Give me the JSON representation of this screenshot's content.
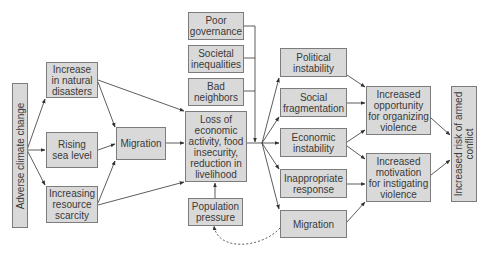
{
  "diagram": {
    "colors": {
      "box_fill": "#d9d9d9",
      "box_border": "#7c7c7c",
      "text": "#3a3a3a",
      "arrow": "#333333"
    },
    "nodes": {
      "adverse_climate_change": "Adverse climate change",
      "natural_disasters": "Increase\nin natural\ndisasters",
      "sea_level": "Rising\nsea level",
      "resource_scarcity": "Increasing\nresource\nscarcity",
      "migration_left": "Migration",
      "poor_governance": "Poor\ngovernance",
      "societal_inequalities": "Societal\ninequalities",
      "bad_neighbors": "Bad\nneighbors",
      "loss_economic": "Loss of\neconomic\nactivity, food\ninsecurity,\nreduction in\nlivelihood",
      "population_pressure": "Population\npressure",
      "political_instability": "Political\ninstability",
      "social_fragmentation": "Social\nfragmentation",
      "economic_instability": "Economic\ninstability",
      "inappropriate_response": "Inappropriate\nresponse",
      "migration_right": "Migration",
      "increased_opportunity": "Increased\nopportunity\nfor organizing\nviolence",
      "increased_motivation": "Increased\nmotivation\nfor instigating\nviolence",
      "increased_risk": "Increased risk of armed\nconflict"
    },
    "edges": [
      [
        "adverse_climate_change",
        "natural_disasters"
      ],
      [
        "adverse_climate_change",
        "sea_level"
      ],
      [
        "adverse_climate_change",
        "resource_scarcity"
      ],
      [
        "natural_disasters",
        "migration_left"
      ],
      [
        "sea_level",
        "migration_left"
      ],
      [
        "resource_scarcity",
        "migration_left"
      ],
      [
        "natural_disasters",
        "loss_economic"
      ],
      [
        "migration_left",
        "loss_economic"
      ],
      [
        "resource_scarcity",
        "loss_economic"
      ],
      [
        "poor_governance",
        "loss_economic_bus"
      ],
      [
        "societal_inequalities",
        "loss_economic_bus"
      ],
      [
        "bad_neighbors",
        "loss_economic_bus"
      ],
      [
        "population_pressure",
        "loss_economic"
      ],
      [
        "loss_economic",
        "political_instability"
      ],
      [
        "loss_economic",
        "social_fragmentation"
      ],
      [
        "loss_economic",
        "economic_instability"
      ],
      [
        "loss_economic",
        "inappropriate_response"
      ],
      [
        "loss_economic",
        "migration_right"
      ],
      [
        "political_instability",
        "increased_opportunity"
      ],
      [
        "social_fragmentation",
        "increased_opportunity"
      ],
      [
        "economic_instability",
        "increased_opportunity"
      ],
      [
        "economic_instability",
        "increased_motivation"
      ],
      [
        "inappropriate_response",
        "increased_motivation"
      ],
      [
        "migration_right",
        "increased_motivation"
      ],
      [
        "increased_opportunity",
        "increased_risk"
      ],
      [
        "increased_motivation",
        "increased_risk"
      ],
      [
        "migration_right",
        "population_pressure",
        "dashed"
      ]
    ]
  }
}
